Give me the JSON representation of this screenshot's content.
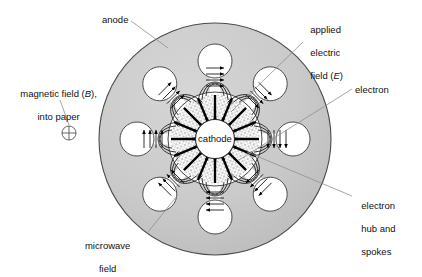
{
  "diagram": {
    "colors": {
      "anode_fill": "#c9c9c9",
      "anode_stroke": "#4a4a4a",
      "cavity_fill": "#ffffff",
      "spoke_stipple": "#6e6e6e",
      "arrow": "#000000",
      "leader": "#8a8a8a",
      "background": "#ffffff",
      "text": "#111111"
    },
    "geometry": {
      "anode_center_x": 215,
      "anode_center_y": 139,
      "anode_outer_radius": 116,
      "anode_inner_radius": 47,
      "cathode_radius": 19,
      "cavity_count": 8,
      "cavity_radius": 17,
      "cavity_orbit_radius": 78
    },
    "center_part": {
      "label": "cathode"
    },
    "labels": [
      {
        "id": "anode",
        "text": "anode",
        "x": 102,
        "y": 14,
        "leader": {
          "x1": 129,
          "y1": 25,
          "x2": 165,
          "y2": 48
        }
      },
      {
        "id": "magnetic-field",
        "line1": "magnetic field (",
        "italic": "B",
        "line1_end": "),",
        "line2": "into paper",
        "x": 4,
        "y": 76,
        "leader": {
          "x1": 60,
          "y1": 100,
          "x2": 66,
          "y2": 126
        }
      },
      {
        "id": "applied-electric-field",
        "line1": "applied",
        "line2": "electric",
        "line3": "field (",
        "italic": "E",
        "line3_end": ")",
        "x": 305,
        "y": 12,
        "leader": {
          "x1": 303,
          "y1": 40,
          "x2": 232,
          "y2": 112
        }
      },
      {
        "id": "electron",
        "text": "electron",
        "x": 355,
        "y": 84,
        "leader": {
          "x1": 352,
          "y1": 89,
          "x2": 238,
          "y2": 160
        }
      },
      {
        "id": "electron-hub-and-spokes",
        "line1": "electron",
        "line2": "hub and",
        "line3": "spokes",
        "x": 356,
        "y": 188,
        "leader": {
          "x1": 352,
          "y1": 196,
          "x2": 246,
          "y2": 152
        }
      },
      {
        "id": "microwave-field",
        "line1": "microwave",
        "line2": "field",
        "x": 62,
        "y": 228,
        "leader": {
          "x1": 148,
          "y1": 234,
          "x2": 176,
          "y2": 196
        }
      }
    ],
    "label_text": {
      "anode": "anode",
      "magnetic_field_l1": "magnetic field (B),",
      "magnetic_field_l2": "into paper",
      "applied_l1": "applied",
      "applied_l2": "electric",
      "applied_l3": "field (E)",
      "electron": "electron",
      "hub_l1": "electron",
      "hub_l2": "hub and",
      "hub_l3": "spokes",
      "microwave_l1": "microwave",
      "microwave_l2": "field",
      "cathode": "cathode"
    },
    "magnetic_symbol": {
      "name": "circle-with-cross-icon",
      "meaning": "field into paper",
      "cx": 69,
      "cy": 133,
      "r": 7
    }
  }
}
